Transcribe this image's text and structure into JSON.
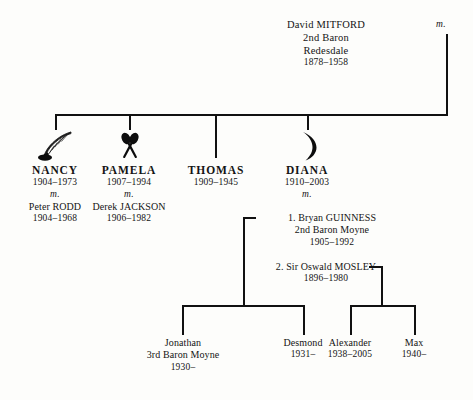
{
  "diagram": {
    "type": "family-tree",
    "title_person": "David MITFORD, 2nd Baron Redesdale"
  },
  "root": {
    "name": "David MITFORD",
    "title": "2nd Baron",
    "title2": "Redesdale",
    "dates": "1878–1958",
    "marriage_marker": "m."
  },
  "children": [
    {
      "name": "NANCY",
      "dates": "1904–1973",
      "marriage_marker": "m.",
      "spouse": "Peter RODD",
      "spouse_dates": "1904–1968",
      "icon": "quill-pen-icon"
    },
    {
      "name": "PAMELA",
      "dates": "1907–1994",
      "marriage_marker": "m.",
      "spouse": "Derek JACKSON",
      "spouse_dates": "1906–1982",
      "icon": "crossed-spoons-icon"
    },
    {
      "name": "THOMAS",
      "dates": "1909–1945",
      "icon": "none"
    },
    {
      "name": "DIANA",
      "dates": "1910–2003",
      "marriage_marker": "m.",
      "icon": "crescent-moon-icon",
      "marriages": [
        {
          "index": "1. Bryan GUINNESS",
          "title": "2nd Baron Moyne",
          "dates": "1905–1992"
        },
        {
          "index": "2. Sir Oswald MOSLEY",
          "dates": "1896–1980"
        }
      ]
    }
  ],
  "grandchildren": {
    "guinness": [
      {
        "name": "Jonathan",
        "title": "3rd Baron Moyne",
        "dates": "1930–"
      },
      {
        "name": "Desmond",
        "dates": "1931–"
      }
    ],
    "mosley": [
      {
        "name": "Alexander",
        "dates": "1938–2005"
      },
      {
        "name": "Max",
        "dates": "1940–"
      }
    ]
  },
  "colors": {
    "ink": "#111111",
    "paper": "#fdfdfb"
  }
}
